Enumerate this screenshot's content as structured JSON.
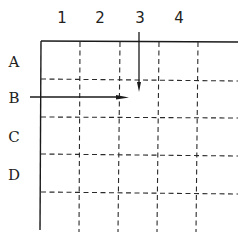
{
  "diagram": {
    "title": "",
    "column_labels": [
      "1",
      "2",
      "3",
      "4"
    ],
    "row_labels": [
      "A",
      "B",
      "C",
      "D"
    ],
    "grid": {
      "columns": 5,
      "rows": 5,
      "border_style": "solid top and left edges",
      "inner_line_style": "dashed"
    },
    "arrows": [
      {
        "name": "column-3-arrow",
        "from_label": "3",
        "direction": "down"
      },
      {
        "name": "row-b-arrow",
        "from_label": "B",
        "direction": "right"
      }
    ],
    "colors": {
      "line": "#1a1a1a",
      "background": "#ffffff"
    }
  }
}
